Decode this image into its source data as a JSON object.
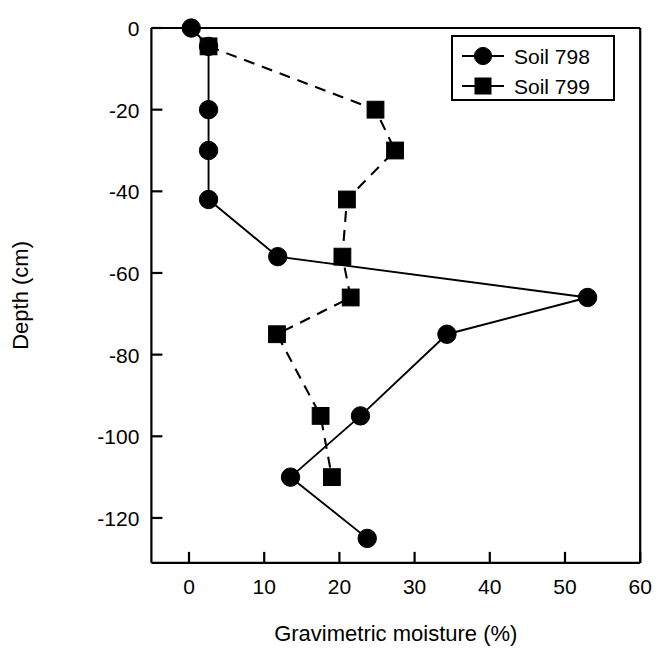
{
  "chart_data": {
    "type": "line",
    "title": "",
    "xlabel": "Gravimetric moisture (%)",
    "ylabel": "Depth (cm)",
    "xlim": [
      -5,
      60
    ],
    "ylim": [
      -131,
      0
    ],
    "xticks": [
      0,
      10,
      20,
      30,
      40,
      50,
      60
    ],
    "xtick_labels": [
      "0",
      "10",
      "20",
      "30",
      "40",
      "50",
      "60"
    ],
    "yticks": [
      0,
      -20,
      -40,
      -60,
      -80,
      -100,
      -120
    ],
    "ytick_labels": [
      "0",
      "-20",
      "-40",
      "-60",
      "-80",
      "-100",
      "-120"
    ],
    "grid": false,
    "legend_position": "top-right",
    "series": [
      {
        "name": "Soil 798",
        "marker": "circle",
        "linestyle": "solid",
        "color": "#000000",
        "x": [
          0.3,
          2.6,
          2.6,
          2.6,
          2.6,
          11.8,
          53.0,
          34.3,
          22.8,
          13.5,
          23.7
        ],
        "y": [
          0,
          -4.5,
          -20,
          -30,
          -42,
          -56,
          -66,
          -75,
          -95,
          -110,
          -125
        ]
      },
      {
        "name": "Soil 799",
        "marker": "square",
        "linestyle": "dashed",
        "color": "#000000",
        "x": [
          2.6,
          24.8,
          27.4,
          21.0,
          20.4,
          21.5,
          11.7,
          17.5,
          19.0
        ],
        "y": [
          -4.5,
          -20,
          -30,
          -42,
          -56,
          -66,
          -75,
          -95,
          -110
        ]
      }
    ]
  },
  "legend": {
    "entries": [
      {
        "label": "Soil 798",
        "marker": "circle-marker-icon"
      },
      {
        "label": "Soil 799",
        "marker": "square-marker-icon"
      }
    ]
  },
  "axes": {
    "x_title": "Gravimetric moisture (%)",
    "y_title": "Depth (cm)"
  }
}
